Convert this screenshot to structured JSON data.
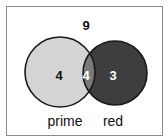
{
  "diagram": {
    "type": "venn",
    "universe_count": "9",
    "sets": [
      {
        "name": "prime",
        "only_count": "4",
        "fill": "#d4d4d4"
      },
      {
        "name": "red",
        "only_count": "3",
        "fill": "#3e3e3e"
      }
    ],
    "intersection_count": "4",
    "intersection_fill": "#7a7a7a",
    "outline_color": "#1a1a1a"
  }
}
